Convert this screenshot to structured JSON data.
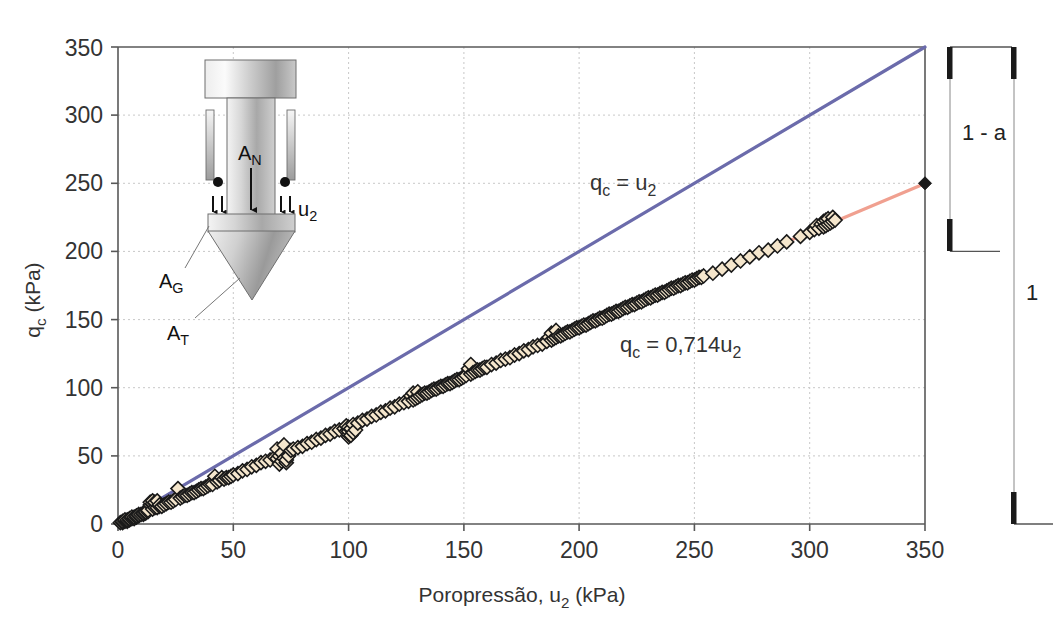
{
  "chart_data": {
    "type": "scatter",
    "title": "",
    "xlabel": "Poropressão, u₂ (kPa)",
    "ylabel": "qᴄ (kPa)",
    "xlim": [
      0,
      350
    ],
    "ylim": [
      0,
      350
    ],
    "xticks": [
      0,
      50,
      100,
      150,
      200,
      250,
      300,
      350
    ],
    "yticks": [
      0,
      50,
      100,
      150,
      200,
      250,
      300,
      350
    ],
    "xtick_labels": [
      "0",
      "50",
      "100",
      "150",
      "200",
      "250",
      "300",
      "350"
    ],
    "ytick_labels": [
      "0",
      "50",
      "100",
      "150",
      "200",
      "250",
      "300",
      "350"
    ],
    "grid": true,
    "grid_style": "dotted",
    "legend": "none",
    "series": [
      {
        "name": "q_c = u2 (linha de igualdade)",
        "type": "line",
        "color": "#6b6bab",
        "equation_label": "qᴄ = u₂",
        "slope": 1.0,
        "intercept": 0,
        "x": [
          0,
          350
        ],
        "y": [
          0,
          350
        ],
        "label_x": 205,
        "label_y": 268
      },
      {
        "name": "q_c = 0,714u2 (regressão)",
        "type": "line",
        "color": "#f0a090",
        "equation_label": "qᴄ = 0,714u₂",
        "slope": 0.714,
        "intercept": 0,
        "x": [
          0,
          350
        ],
        "y": [
          0,
          249.9
        ],
        "label_x": 232,
        "label_y": 153
      },
      {
        "name": "dados ensaio",
        "type": "scatter",
        "marker": "diamond",
        "marker_face": "#f5e6cc",
        "marker_edge": "#1a1a1a",
        "points": [
          [
            1,
            1
          ],
          [
            2,
            1
          ],
          [
            2,
            2
          ],
          [
            3,
            2
          ],
          [
            3,
            3
          ],
          [
            4,
            2
          ],
          [
            4,
            3
          ],
          [
            5,
            3
          ],
          [
            5,
            4
          ],
          [
            6,
            4
          ],
          [
            6,
            5
          ],
          [
            7,
            4
          ],
          [
            7,
            5
          ],
          [
            8,
            5
          ],
          [
            8,
            6
          ],
          [
            9,
            6
          ],
          [
            9,
            7
          ],
          [
            10,
            7
          ],
          [
            11,
            7
          ],
          [
            11,
            8
          ],
          [
            12,
            8
          ],
          [
            12,
            9
          ],
          [
            13,
            9
          ],
          [
            13,
            10
          ],
          [
            14,
            14
          ],
          [
            14,
            16
          ],
          [
            15,
            11
          ],
          [
            15,
            15
          ],
          [
            15,
            17
          ],
          [
            16,
            12
          ],
          [
            16,
            16
          ],
          [
            17,
            12
          ],
          [
            17,
            17
          ],
          [
            18,
            13
          ],
          [
            18,
            14
          ],
          [
            19,
            13
          ],
          [
            20,
            14
          ],
          [
            21,
            15
          ],
          [
            22,
            16
          ],
          [
            23,
            16
          ],
          [
            24,
            17
          ],
          [
            25,
            18
          ],
          [
            26,
            26
          ],
          [
            27,
            19
          ],
          [
            28,
            20
          ],
          [
            29,
            21
          ],
          [
            30,
            21
          ],
          [
            31,
            22
          ],
          [
            32,
            23
          ],
          [
            33,
            23
          ],
          [
            34,
            24
          ],
          [
            35,
            25
          ],
          [
            36,
            26
          ],
          [
            37,
            26
          ],
          [
            38,
            27
          ],
          [
            39,
            28
          ],
          [
            40,
            29
          ],
          [
            41,
            29
          ],
          [
            42,
            35
          ],
          [
            43,
            31
          ],
          [
            44,
            32
          ],
          [
            45,
            34
          ],
          [
            46,
            33
          ],
          [
            47,
            34
          ],
          [
            48,
            34
          ],
          [
            49,
            35
          ],
          [
            50,
            36
          ],
          [
            52,
            37
          ],
          [
            54,
            39
          ],
          [
            56,
            40
          ],
          [
            58,
            42
          ],
          [
            60,
            43
          ],
          [
            62,
            45
          ],
          [
            64,
            46
          ],
          [
            66,
            47
          ],
          [
            68,
            49
          ],
          [
            69,
            48
          ],
          [
            69,
            55
          ],
          [
            70,
            50
          ],
          [
            70,
            44
          ],
          [
            71,
            46
          ],
          [
            71,
            52
          ],
          [
            72,
            48
          ],
          [
            72,
            58
          ],
          [
            73,
            45
          ],
          [
            73,
            47
          ],
          [
            74,
            50
          ],
          [
            75,
            54
          ],
          [
            76,
            55
          ],
          [
            78,
            56
          ],
          [
            80,
            57
          ],
          [
            82,
            59
          ],
          [
            84,
            60
          ],
          [
            86,
            62
          ],
          [
            88,
            63
          ],
          [
            90,
            65
          ],
          [
            92,
            66
          ],
          [
            94,
            68
          ],
          [
            96,
            69
          ],
          [
            98,
            70
          ],
          [
            99,
            68
          ],
          [
            99,
            72
          ],
          [
            100,
            64
          ],
          [
            100,
            66
          ],
          [
            100,
            68
          ],
          [
            100,
            71
          ],
          [
            101,
            65
          ],
          [
            101,
            70
          ],
          [
            102,
            67
          ],
          [
            102,
            73
          ],
          [
            103,
            69
          ],
          [
            104,
            74
          ],
          [
            106,
            76
          ],
          [
            108,
            77
          ],
          [
            110,
            79
          ],
          [
            112,
            80
          ],
          [
            114,
            82
          ],
          [
            116,
            83
          ],
          [
            118,
            85
          ],
          [
            120,
            86
          ],
          [
            122,
            88
          ],
          [
            124,
            89
          ],
          [
            126,
            90
          ],
          [
            127,
            94
          ],
          [
            128,
            91
          ],
          [
            128,
            96
          ],
          [
            129,
            92
          ],
          [
            130,
            93
          ],
          [
            130,
            97
          ],
          [
            131,
            94
          ],
          [
            132,
            95
          ],
          [
            133,
            96
          ],
          [
            134,
            96
          ],
          [
            135,
            97
          ],
          [
            136,
            98
          ],
          [
            137,
            99
          ],
          [
            138,
            99
          ],
          [
            139,
            100
          ],
          [
            140,
            101
          ],
          [
            141,
            101
          ],
          [
            142,
            102
          ],
          [
            143,
            103
          ],
          [
            144,
            103
          ],
          [
            145,
            104
          ],
          [
            146,
            105
          ],
          [
            147,
            106
          ],
          [
            148,
            106
          ],
          [
            149,
            107
          ],
          [
            150,
            108
          ],
          [
            151,
            109
          ],
          [
            152,
            114
          ],
          [
            153,
            110
          ],
          [
            153,
            117
          ],
          [
            154,
            111
          ],
          [
            155,
            112
          ],
          [
            156,
            113
          ],
          [
            157,
            113
          ],
          [
            158,
            114
          ],
          [
            159,
            115
          ],
          [
            160,
            115
          ],
          [
            162,
            117
          ],
          [
            164,
            118
          ],
          [
            166,
            120
          ],
          [
            168,
            121
          ],
          [
            170,
            122
          ],
          [
            172,
            124
          ],
          [
            174,
            125
          ],
          [
            176,
            127
          ],
          [
            178,
            128
          ],
          [
            180,
            130
          ],
          [
            182,
            131
          ],
          [
            184,
            132
          ],
          [
            186,
            134
          ],
          [
            187,
            137
          ],
          [
            188,
            135
          ],
          [
            188,
            140
          ],
          [
            189,
            136
          ],
          [
            190,
            137
          ],
          [
            190,
            142
          ],
          [
            191,
            138
          ],
          [
            192,
            138
          ],
          [
            193,
            139
          ],
          [
            194,
            140
          ],
          [
            195,
            141
          ],
          [
            196,
            141
          ],
          [
            197,
            142
          ],
          [
            198,
            143
          ],
          [
            199,
            144
          ],
          [
            200,
            144
          ],
          [
            201,
            145
          ],
          [
            202,
            146
          ],
          [
            203,
            146
          ],
          [
            204,
            147
          ],
          [
            205,
            148
          ],
          [
            206,
            149
          ],
          [
            207,
            149
          ],
          [
            208,
            150
          ],
          [
            209,
            151
          ],
          [
            210,
            151
          ],
          [
            211,
            152
          ],
          [
            212,
            153
          ],
          [
            213,
            154
          ],
          [
            214,
            154
          ],
          [
            215,
            155
          ],
          [
            216,
            156
          ],
          [
            217,
            156
          ],
          [
            218,
            157
          ],
          [
            219,
            158
          ],
          [
            220,
            159
          ],
          [
            221,
            159
          ],
          [
            222,
            160
          ],
          [
            223,
            161
          ],
          [
            224,
            161
          ],
          [
            225,
            162
          ],
          [
            226,
            163
          ],
          [
            227,
            163
          ],
          [
            228,
            164
          ],
          [
            229,
            165
          ],
          [
            230,
            166
          ],
          [
            231,
            166
          ],
          [
            232,
            167
          ],
          [
            233,
            168
          ],
          [
            234,
            168
          ],
          [
            235,
            169
          ],
          [
            236,
            170
          ],
          [
            237,
            170
          ],
          [
            238,
            171
          ],
          [
            239,
            172
          ],
          [
            240,
            173
          ],
          [
            241,
            173
          ],
          [
            242,
            174
          ],
          [
            243,
            175
          ],
          [
            244,
            175
          ],
          [
            245,
            176
          ],
          [
            246,
            177
          ],
          [
            247,
            177
          ],
          [
            248,
            178
          ],
          [
            249,
            179
          ],
          [
            250,
            179
          ],
          [
            251,
            180
          ],
          [
            252,
            181
          ],
          [
            253,
            181
          ],
          [
            254,
            182
          ],
          [
            258,
            184
          ],
          [
            262,
            187
          ],
          [
            266,
            190
          ],
          [
            270,
            193
          ],
          [
            274,
            196
          ],
          [
            278,
            199
          ],
          [
            282,
            201
          ],
          [
            286,
            204
          ],
          [
            290,
            207
          ],
          [
            296,
            211
          ],
          [
            300,
            214
          ],
          [
            302,
            216
          ],
          [
            303,
            219
          ],
          [
            304,
            217
          ],
          [
            305,
            220
          ],
          [
            306,
            218
          ],
          [
            306,
            222
          ],
          [
            307,
            219
          ],
          [
            307,
            223
          ],
          [
            308,
            220
          ],
          [
            308,
            224
          ],
          [
            309,
            221
          ],
          [
            310,
            222
          ],
          [
            310,
            225
          ],
          [
            311,
            223
          ]
        ]
      }
    ],
    "endpoint_marker": {
      "name": "ponto final da regressão",
      "x": 350,
      "y": 250,
      "color": "#1a1a1a",
      "marker": "diamond"
    },
    "annotations": [
      {
        "name": "dim-1-minus-a",
        "text": "1 - a",
        "value_from": 350,
        "value_to": 250
      },
      {
        "name": "dim-1",
        "text": "1",
        "value_from": 350,
        "value_to": 0
      }
    ]
  },
  "inset_diagram": {
    "name": "cone-penetrometer-diagram",
    "labels": {
      "net_area": "A",
      "net_area_sub": "N",
      "pore_pressure": "u",
      "pore_pressure_sub": "2",
      "gap_area": "A",
      "gap_area_sub": "G",
      "tip_area": "A",
      "tip_area_sub": "T"
    }
  },
  "axis": {
    "x_title_main": "Poropressão, u",
    "x_title_sub": "2",
    "x_title_unit": " (kPa)",
    "y_title_main": "q",
    "y_title_sub": "c",
    "y_title_unit": " (kPa)"
  },
  "colors": {
    "equality_line": "#6b6bab",
    "regression_line": "#f0a090",
    "marker_face": "#f5e6cc",
    "marker_edge": "#1a1a1a",
    "axis": "#555555",
    "grid": "#cccccc",
    "background": "#ffffff"
  }
}
